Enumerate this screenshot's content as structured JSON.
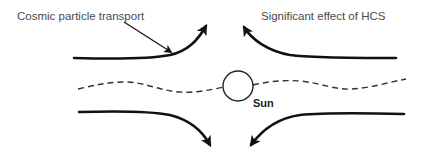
{
  "diagram": {
    "labels": {
      "cosmic_transport": "Cosmic particle transport",
      "hcs_effect": "Significant effect of HCS",
      "sun": "Sun"
    },
    "elements": {
      "flow_lines": [
        {
          "id": "upper-left",
          "direction": "toward top center"
        },
        {
          "id": "upper-right",
          "direction": "toward top center"
        },
        {
          "id": "lower-left",
          "direction": "toward bottom center"
        },
        {
          "id": "lower-right",
          "direction": "toward bottom center"
        }
      ],
      "current_sheet": "dashed wavy line through Sun",
      "sun": "circle"
    },
    "colors": {
      "lines": "#111111",
      "text": "#4a4a4a",
      "background": "#ffffff"
    }
  }
}
